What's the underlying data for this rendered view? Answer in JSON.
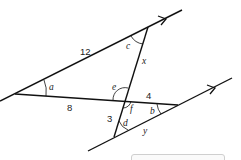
{
  "diagram": {
    "lengths": {
      "upper_segment": "12",
      "lower_left_segment": "8",
      "right_segment": "4",
      "lower_steep_segment": "3",
      "unknown_steep": "x",
      "unknown_bottom": "y"
    },
    "angles": {
      "a": "a",
      "b": "b",
      "c": "c",
      "d": "d",
      "e": "e",
      "f": "f"
    },
    "colors": {
      "line": "#111111",
      "answer_box_border": "#cfcfcf"
    }
  }
}
